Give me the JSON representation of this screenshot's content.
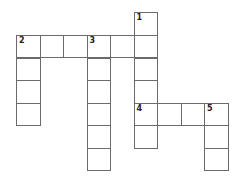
{
  "puzzle": {
    "type": "crossword",
    "words": [
      {
        "number": "1",
        "direction": "down",
        "start": [
          5,
          0
        ],
        "length": 6
      },
      {
        "number": "2",
        "direction": "across",
        "start": [
          0,
          1
        ],
        "length": 6
      },
      {
        "number": "2",
        "direction": "down",
        "start": [
          0,
          1
        ],
        "length": 4
      },
      {
        "number": "3",
        "direction": "down",
        "start": [
          3,
          1
        ],
        "length": 6
      },
      {
        "number": "4",
        "direction": "across",
        "start": [
          5,
          4
        ],
        "length": 4
      },
      {
        "number": "5",
        "direction": "down",
        "start": [
          8,
          4
        ],
        "length": 3
      }
    ],
    "numbered_cells": [
      {
        "number": "1",
        "col": 5,
        "row": 0
      },
      {
        "number": "2",
        "col": 0,
        "row": 1
      },
      {
        "number": "3",
        "col": 3,
        "row": 1
      },
      {
        "number": "4",
        "col": 5,
        "row": 4
      },
      {
        "number": "5",
        "col": 8,
        "row": 4
      }
    ]
  }
}
